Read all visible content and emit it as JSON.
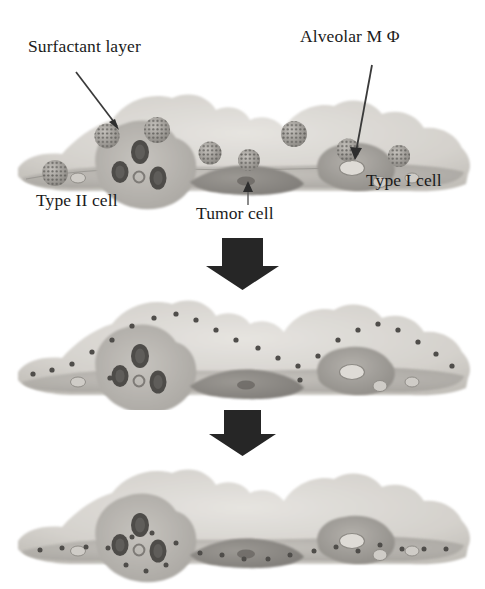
{
  "figure": {
    "background_color": "#ffffff",
    "panel_count": 3
  },
  "labels": {
    "surfactant_layer": "Surfactant layer",
    "alveolar_macrophage": "Alveolar M Φ",
    "type_ii_cell": "Type II cell",
    "tumor_cell": "Tumor cell",
    "type_i_cell": "Type I cell"
  },
  "colors": {
    "background": "#ffffff",
    "text": "#1b1b1b",
    "arrow_leader": "#3a3a3a",
    "block_arrow": "#262626",
    "epithelium_light": "#d8d6d2",
    "epithelium_mid": "#bdbab5",
    "epithelium_dark": "#9a9792",
    "tumor_cell": "#8e8b86",
    "macrophage": "#a5a29d",
    "lamellar_body": "#4f4d4a",
    "nanoparticle": "#9d9a95",
    "nanoparticle_pore": "#595754"
  },
  "panels": [
    {
      "id": "panel-top",
      "stage": "deposition",
      "description": "Nanoparticles deposited on the surfactant layer above the alveolar epithelium",
      "nanoparticles_external": 8,
      "nanoparticles_internal": 0,
      "has_labels": true
    },
    {
      "id": "panel-mid",
      "stage": "surfactant-wetting",
      "description": "Nanoparticles wetted and displaced into the surfactant layer, shown as small dots along the cell surface",
      "nanoparticles_external": 0,
      "nanoparticles_internal": 24,
      "has_labels": false
    },
    {
      "id": "panel-bot",
      "stage": "uptake",
      "description": "Nanoparticles internalized within the epithelial and tumor cells",
      "nanoparticles_external": 0,
      "nanoparticles_internal": 22,
      "has_labels": false
    }
  ],
  "cells": [
    {
      "name": "type-ii-cell",
      "lamellar_bodies": 3,
      "nucleus": 1
    },
    {
      "name": "type-i-cell",
      "lamellar_bodies": 0,
      "nucleus": 1
    },
    {
      "name": "tumor-cell",
      "lamellar_bodies": 0,
      "nucleus": 1
    },
    {
      "name": "alveolar-macrophage",
      "lamellar_bodies": 0,
      "nucleus": 1
    }
  ],
  "leader_arrows": [
    {
      "name": "surfactant-layer-arrow",
      "from": "Surfactant layer",
      "direction": "down-right"
    },
    {
      "name": "alveolar-macrophage-arrow",
      "from": "Alveolar M Φ",
      "direction": "down"
    },
    {
      "name": "tumor-cell-arrow",
      "from": "Tumor cell",
      "direction": "up"
    }
  ],
  "flow_arrows": [
    {
      "name": "flow-arrow-1",
      "direction": "down"
    },
    {
      "name": "flow-arrow-2",
      "direction": "down"
    }
  ]
}
